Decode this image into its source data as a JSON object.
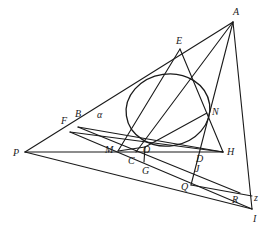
{
  "diagram": {
    "type": "geometry-construction",
    "stroke_color": "#1a1a1a",
    "background": "#ffffff",
    "ellipse": {
      "cx": 168,
      "cy": 110,
      "rx": 42,
      "ry": 36
    },
    "points": {
      "A": {
        "label": "A",
        "x": 233,
        "y": 22,
        "lx": 233,
        "ly": 15
      },
      "E": {
        "label": "E",
        "x": 180,
        "y": 49,
        "lx": 176,
        "ly": 44
      },
      "N": {
        "label": "N",
        "x": 207,
        "y": 113,
        "lx": 212,
        "ly": 115
      },
      "H": {
        "label": "H",
        "x": 223,
        "y": 152,
        "lx": 227,
        "ly": 155
      },
      "B": {
        "label": "B",
        "x": 78,
        "y": 127,
        "lx": 75,
        "ly": 117
      },
      "alpha": {
        "label": "α",
        "x": 97,
        "y": 118,
        "lx": 97,
        "ly": 118
      },
      "F": {
        "label": "F",
        "x": 70,
        "y": 132,
        "lx": 61,
        "ly": 124
      },
      "P": {
        "label": "P",
        "x": 25,
        "y": 152,
        "lx": 13,
        "ly": 156
      },
      "M": {
        "label": "M",
        "x": 118,
        "y": 151,
        "lx": 105,
        "ly": 153
      },
      "C": {
        "label": "C",
        "x": 136,
        "y": 152,
        "lx": 128,
        "ly": 164
      },
      "O": {
        "label": "O",
        "x": 145,
        "y": 147,
        "lx": 143,
        "ly": 153
      },
      "G": {
        "label": "G",
        "x": 144,
        "y": 162,
        "lx": 142,
        "ly": 174
      },
      "D": {
        "label": "D",
        "x": 198,
        "y": 152,
        "lx": 196,
        "ly": 162
      },
      "J": {
        "label": "J",
        "x": 195,
        "y": 165,
        "lx": 195,
        "ly": 172
      },
      "Q": {
        "label": "Q",
        "x": 191,
        "y": 185,
        "lx": 181,
        "ly": 190
      },
      "R": {
        "label": "R",
        "x": 240,
        "y": 193,
        "lx": 232,
        "ly": 203
      },
      "I": {
        "label": "I",
        "x": 252,
        "y": 209,
        "lx": 253,
        "ly": 222
      },
      "z": {
        "label": "z",
        "x": 252,
        "y": 196,
        "lx": 254,
        "ly": 201
      }
    },
    "segments": [
      [
        "P",
        "A"
      ],
      [
        "A",
        "I"
      ],
      [
        "P",
        "H"
      ],
      [
        "P",
        "I"
      ],
      [
        "E",
        "M"
      ],
      [
        "E",
        "H"
      ],
      [
        "A",
        "C"
      ],
      [
        "A",
        "Q"
      ],
      [
        "B",
        "H"
      ],
      [
        "F",
        "H"
      ],
      [
        "B",
        "R"
      ],
      [
        "F",
        "I"
      ],
      [
        "O",
        "N"
      ],
      [
        "M",
        "O"
      ],
      [
        "Q",
        "z"
      ],
      [
        "O",
        "G"
      ]
    ]
  }
}
